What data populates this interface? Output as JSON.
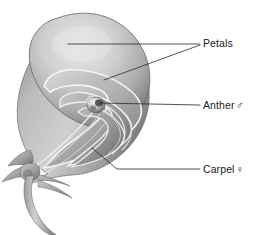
{
  "figure": {
    "type": "botanical-cross-section-illustration",
    "palette": {
      "background": "#ffffff",
      "tissue_light": "#d8d8d8",
      "tissue_mid": "#a8a8a8",
      "tissue_dark": "#6e6e6e",
      "tissue_darkest": "#4a4a4a",
      "outline": "#5a5a5a",
      "highlight": "#f2f2f2",
      "leader_line": "#2a2a2a",
      "text": "#1b1b1b"
    }
  },
  "labels": [
    {
      "id": "petals",
      "text": "Petals",
      "symbol": "",
      "symbol_name": "",
      "leaders": [
        {
          "points": "68,44 200,44"
        },
        {
          "points": "104,80 200,45"
        }
      ]
    },
    {
      "id": "anther",
      "text": "Anther",
      "symbol": "♂",
      "symbol_name": "male-symbol",
      "leaders": [
        {
          "points": "100,103 200,105"
        }
      ]
    },
    {
      "id": "carpel",
      "text": "Carpel",
      "symbol": "♀",
      "symbol_name": "female-symbol",
      "leaders": [
        {
          "points": "92,148 117,169 200,169"
        }
      ]
    }
  ]
}
